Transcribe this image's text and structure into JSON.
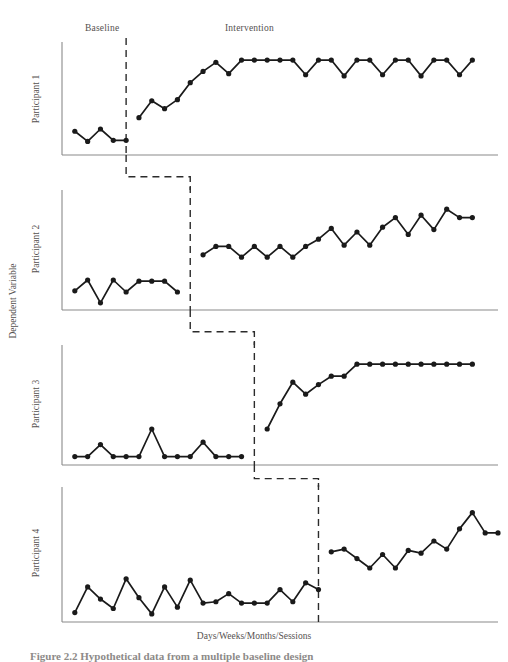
{
  "figure": {
    "phase_labels": {
      "baseline": "Baseline",
      "intervention": "Intervention"
    },
    "y_axis_title": "Dependent Variable",
    "x_axis_title": "Days/Weeks/Months/Sessions",
    "caption": "Figure 2.2  Hypothetical data from a multiple baseline design",
    "panel_labels": [
      "Participant 1",
      "Participant 2",
      "Participant 3",
      "Participant 4"
    ],
    "colors": {
      "line": "#1a1a1a",
      "marker": "#1a1a1a",
      "axis": "#8a8a8a",
      "phase_line": "#2b2b2b",
      "text": "#55514f",
      "background": "#ffffff"
    }
  },
  "chart_data": {
    "type": "line",
    "title": "Hypothetical data from a multiple baseline design",
    "xlabel": "Days/Weeks/Months/Sessions",
    "ylabel": "Dependent Variable",
    "design": "multiple-baseline-across-participants",
    "grid": false,
    "legend": false,
    "axis_tick_labels": false,
    "phase_labels": [
      "Baseline",
      "Intervention"
    ],
    "xlim": [
      0,
      34
    ],
    "ylim": [
      0,
      10
    ],
    "series": [
      {
        "name": "Participant 1",
        "phase_change_x": 5.0,
        "baseline": {
          "x": [
            1,
            2,
            3,
            4,
            5
          ],
          "values": [
            2.1,
            1.2,
            2.3,
            1.3,
            1.3
          ]
        },
        "intervention": {
          "x": [
            6,
            7,
            8,
            9,
            10,
            11,
            12,
            13,
            14,
            15,
            16,
            17,
            18,
            19,
            20,
            21,
            22,
            23,
            24,
            25,
            26,
            27,
            28,
            29,
            30,
            31,
            32
          ],
          "values": [
            3.3,
            4.8,
            4.1,
            4.9,
            6.4,
            7.4,
            8.2,
            7.2,
            8.4,
            8.4,
            8.4,
            8.4,
            8.4,
            7.1,
            8.4,
            8.4,
            7.0,
            8.4,
            8.4,
            7.1,
            8.4,
            8.4,
            7.0,
            8.4,
            8.4,
            7.1,
            8.4
          ]
        }
      },
      {
        "name": "Participant 2",
        "phase_change_x": 10.0,
        "baseline": {
          "x": [
            1,
            2,
            3,
            4,
            5,
            6,
            7,
            8,
            9
          ],
          "values": [
            1.6,
            2.5,
            0.6,
            2.5,
            1.5,
            2.4,
            2.4,
            2.4,
            1.5
          ]
        },
        "intervention": {
          "x": [
            11,
            12,
            13,
            14,
            15,
            16,
            17,
            18,
            19,
            20,
            21,
            22,
            23,
            24,
            25,
            26,
            27,
            28,
            29,
            30,
            31,
            32
          ],
          "values": [
            4.6,
            5.3,
            5.3,
            4.4,
            5.3,
            4.4,
            5.3,
            4.4,
            5.3,
            5.9,
            6.8,
            5.4,
            6.5,
            5.4,
            6.9,
            7.7,
            6.3,
            7.9,
            6.7,
            8.4,
            7.7,
            7.7
          ]
        }
      },
      {
        "name": "Participant 3",
        "phase_change_x": 15.0,
        "baseline": {
          "x": [
            1,
            2,
            3,
            4,
            5,
            6,
            7,
            8,
            9,
            10,
            11,
            12,
            13,
            14
          ],
          "values": [
            0.7,
            0.7,
            1.7,
            0.7,
            0.7,
            0.7,
            3.0,
            0.7,
            0.7,
            0.7,
            1.9,
            0.7,
            0.7,
            0.7
          ]
        },
        "intervention": {
          "x": [
            16,
            17,
            18,
            19,
            20,
            21,
            22,
            23,
            24,
            25,
            26,
            27,
            28,
            29,
            30,
            31,
            32
          ],
          "values": [
            3.0,
            5.1,
            6.9,
            5.9,
            6.7,
            7.4,
            7.4,
            8.4,
            8.4,
            8.4,
            8.4,
            8.4,
            8.4,
            8.4,
            8.4,
            8.4,
            8.4
          ]
        }
      },
      {
        "name": "Participant 4",
        "phase_change_x": 20.0,
        "baseline": {
          "x": [
            1,
            2,
            3,
            4,
            5,
            6,
            7,
            8,
            9,
            10,
            11,
            12,
            13,
            14,
            15,
            16,
            17,
            18,
            19
          ],
          "values": [
            0.7,
            2.6,
            1.7,
            1.0,
            3.2,
            1.8,
            0.6,
            2.6,
            1.1,
            3.1,
            1.4,
            1.5,
            2.1,
            1.4,
            1.4,
            1.4,
            2.4,
            1.5,
            2.9,
            2.4
          ]
        },
        "intervention": {
          "x": [
            21,
            22,
            23,
            24,
            25,
            26,
            27,
            28,
            29,
            30,
            31,
            32,
            33
          ],
          "values": [
            5.2,
            5.4,
            4.7,
            4.0,
            5.0,
            4.0,
            5.3,
            5.1,
            6.0,
            5.4,
            6.9,
            8.1,
            6.6,
            6.6
          ]
        }
      }
    ]
  }
}
